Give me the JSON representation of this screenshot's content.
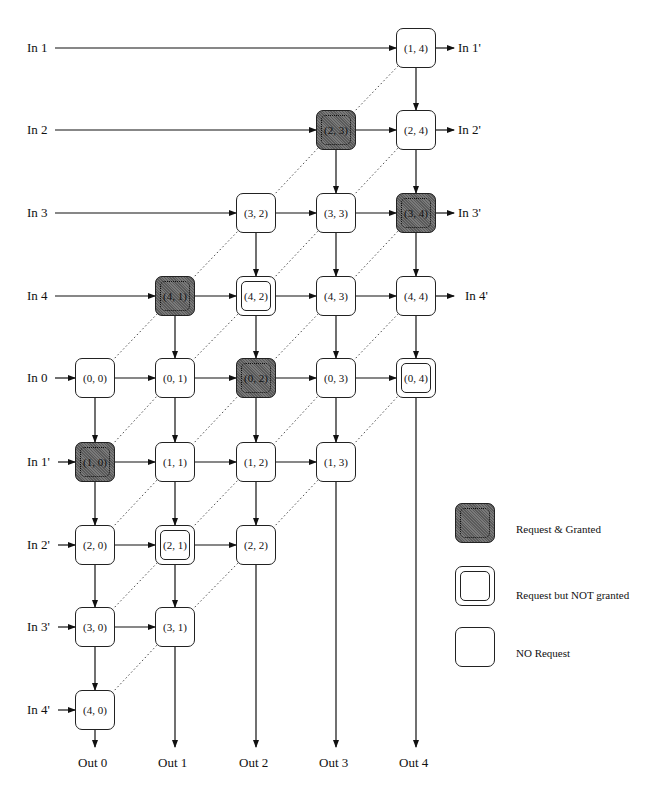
{
  "diagram": {
    "inputs_left": [
      {
        "label": "In 1",
        "row": 0
      },
      {
        "label": "In 2",
        "row": 1
      },
      {
        "label": "In 3",
        "row": 2
      },
      {
        "label": "In 4",
        "row": 3
      },
      {
        "label": "In 0",
        "row": 4
      },
      {
        "label": "In 1'",
        "row": 5
      },
      {
        "label": "In 2'",
        "row": 6
      },
      {
        "label": "In 3'",
        "row": 7
      },
      {
        "label": "In 4'",
        "row": 8
      }
    ],
    "inputs_right": [
      {
        "label": "In 1'",
        "row": 0
      },
      {
        "label": "In 2'",
        "row": 1
      },
      {
        "label": "In 3'",
        "row": 2
      },
      {
        "label": "In 4'",
        "row": 3
      }
    ],
    "outputs": [
      "Out 0",
      "Out 1",
      "Out 2",
      "Out 3",
      "Out 4"
    ],
    "nodes": [
      {
        "label": "(1, 4)",
        "row": 0,
        "col": 4,
        "state": "none"
      },
      {
        "label": "(2, 3)",
        "row": 1,
        "col": 3,
        "state": "granted"
      },
      {
        "label": "(2, 4)",
        "row": 1,
        "col": 4,
        "state": "none"
      },
      {
        "label": "(3, 2)",
        "row": 2,
        "col": 2,
        "state": "none"
      },
      {
        "label": "(3, 3)",
        "row": 2,
        "col": 3,
        "state": "none"
      },
      {
        "label": "(3, 4)",
        "row": 2,
        "col": 4,
        "state": "granted"
      },
      {
        "label": "(4, 1)",
        "row": 3,
        "col": 1,
        "state": "granted"
      },
      {
        "label": "(4, 2)",
        "row": 3,
        "col": 2,
        "state": "notgranted"
      },
      {
        "label": "(4, 3)",
        "row": 3,
        "col": 3,
        "state": "none"
      },
      {
        "label": "(4, 4)",
        "row": 3,
        "col": 4,
        "state": "none"
      },
      {
        "label": "(0, 0)",
        "row": 4,
        "col": 0,
        "state": "none"
      },
      {
        "label": "(0, 1)",
        "row": 4,
        "col": 1,
        "state": "none"
      },
      {
        "label": "(0, 2)",
        "row": 4,
        "col": 2,
        "state": "granted"
      },
      {
        "label": "(0, 3)",
        "row": 4,
        "col": 3,
        "state": "none"
      },
      {
        "label": "(0, 4)",
        "row": 4,
        "col": 4,
        "state": "notgranted"
      },
      {
        "label": "(1, 0)",
        "row": 5,
        "col": 0,
        "state": "granted"
      },
      {
        "label": "(1, 1)",
        "row": 5,
        "col": 1,
        "state": "none"
      },
      {
        "label": "(1, 2)",
        "row": 5,
        "col": 2,
        "state": "none"
      },
      {
        "label": "(1, 3)",
        "row": 5,
        "col": 3,
        "state": "none"
      },
      {
        "label": "(2, 0)",
        "row": 6,
        "col": 0,
        "state": "none"
      },
      {
        "label": "(2, 1)",
        "row": 6,
        "col": 1,
        "state": "notgranted"
      },
      {
        "label": "(2, 2)",
        "row": 6,
        "col": 2,
        "state": "none"
      },
      {
        "label": "(3, 0)",
        "row": 7,
        "col": 0,
        "state": "none"
      },
      {
        "label": "(3, 1)",
        "row": 7,
        "col": 1,
        "state": "none"
      },
      {
        "label": "(4, 0)",
        "row": 8,
        "col": 0,
        "state": "none"
      }
    ],
    "legend": [
      {
        "state": "granted",
        "label": "Request & Granted"
      },
      {
        "state": "notgranted",
        "label": "Request but NOT granted"
      },
      {
        "state": "none",
        "label": "NO Request"
      }
    ]
  }
}
